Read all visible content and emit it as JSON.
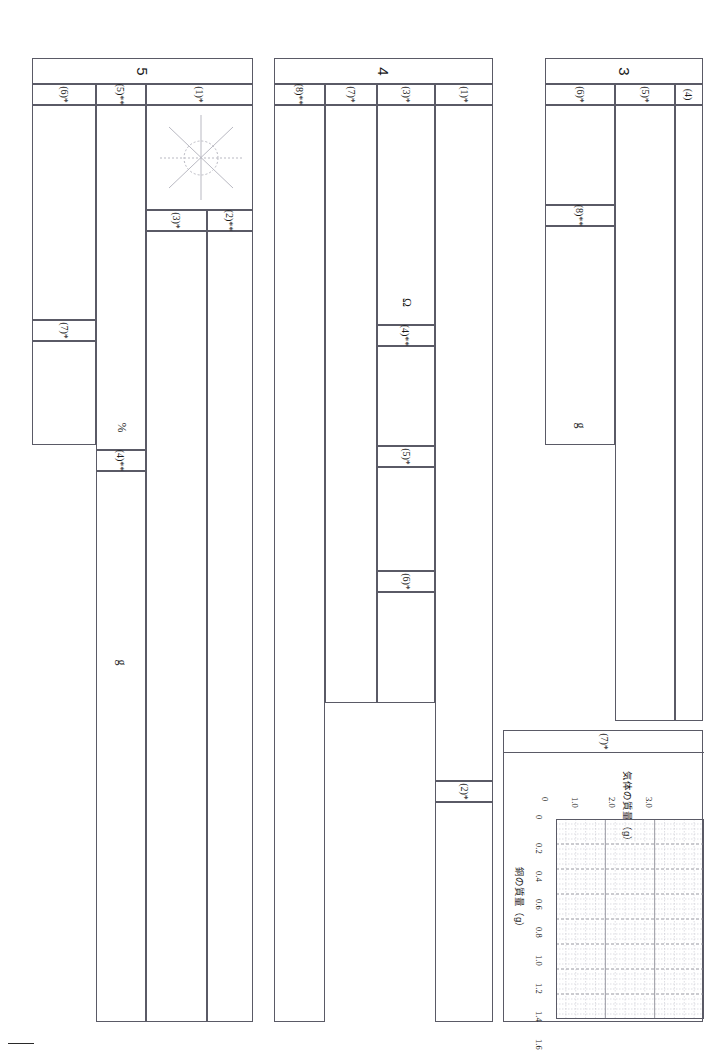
{
  "page": {
    "orientation": "rotated-90-clockwise",
    "type": "answer-sheet",
    "corner_mark": ""
  },
  "blocks": [
    {
      "id": "block-5",
      "number": "5",
      "columns": [
        {
          "key": "q6",
          "label": "(6)*",
          "stars": 1
        },
        {
          "key": "q5",
          "label": "(5)**",
          "stars": 2
        },
        {
          "key": "q1",
          "label": "(1)*",
          "stars": 1
        }
      ],
      "subcells": [
        {
          "key": "q7",
          "label": "(7)*"
        },
        {
          "key": "q3",
          "label": "(3)*"
        },
        {
          "key": "q2",
          "label": "(2)**"
        },
        {
          "key": "q4",
          "label": "(4)**"
        }
      ],
      "units": [
        {
          "key": "percent",
          "text": "%"
        },
        {
          "key": "gram",
          "text": "g"
        }
      ],
      "figure": {
        "name": "compass-star-diagram",
        "rays": 8,
        "circle": true
      }
    },
    {
      "id": "block-4",
      "number": "4",
      "columns": [
        {
          "key": "q8",
          "label": "(8)**",
          "stars": 2
        },
        {
          "key": "q7",
          "label": "(7)*",
          "stars": 1
        },
        {
          "key": "q3",
          "label": "(3)*",
          "stars": 1
        },
        {
          "key": "q1",
          "label": "(1)*",
          "stars": 1
        }
      ],
      "subcells": [
        {
          "key": "q4",
          "label": "(4)**"
        },
        {
          "key": "q5",
          "label": "(5)*"
        },
        {
          "key": "q6",
          "label": "(6)*"
        },
        {
          "key": "q2",
          "label": "(2)*"
        }
      ],
      "units": [
        {
          "key": "ohm",
          "text": "Ω"
        }
      ]
    },
    {
      "id": "block-3",
      "number": "3",
      "columns": [
        {
          "key": "q6",
          "label": "(6)*",
          "stars": 1
        },
        {
          "key": "q5",
          "label": "(5)*",
          "stars": 1
        },
        {
          "key": "q4",
          "label": "(4)",
          "stars": 0
        }
      ],
      "subcells": [
        {
          "key": "q8",
          "label": "(8)**"
        }
      ],
      "units": [
        {
          "key": "gram",
          "text": "g"
        }
      ]
    }
  ],
  "graph_panel": {
    "header_label": "(7)*"
  },
  "chart_data": {
    "type": "line",
    "title": "",
    "xlabel": "銅の質量（g）",
    "ylabel": "気体の質量（g）",
    "xlim": [
      0,
      1.6
    ],
    "ylim": [
      0,
      3.0
    ],
    "xticks": [
      "0",
      "0.2",
      "0.4",
      "0.6",
      "0.8",
      "1.0",
      "1.2",
      "1.4",
      "1.6"
    ],
    "yticks": [
      "0",
      "1.0",
      "2.0",
      "3.0"
    ],
    "xtick_values": [
      0,
      0.2,
      0.4,
      0.6,
      0.8,
      1.0,
      1.2,
      1.4,
      1.6
    ],
    "ytick_values": [
      0,
      1.0,
      2.0,
      3.0
    ],
    "grid": true,
    "grid_minor": true,
    "minor_divisions_x": 5,
    "minor_divisions_y": 5,
    "series": [],
    "legend": "none",
    "note": "blank answer grid for plotting"
  },
  "colors": {
    "line": "#5a5a66",
    "grid_major": "#8c8c96",
    "grid_minor": "#c8c8d0",
    "text": "#1a1a1a",
    "background": "#ffffff"
  }
}
